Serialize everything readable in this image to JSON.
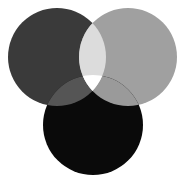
{
  "diagram": {
    "type": "venn-3",
    "background": "#ffffff",
    "circles": [
      {
        "id": "left",
        "cx": 57,
        "cy": 57,
        "r": 49,
        "color": "#3a3a3a"
      },
      {
        "id": "right",
        "cx": 128,
        "cy": 57,
        "r": 49,
        "color": "#a0a0a0"
      },
      {
        "id": "bottom",
        "cx": 93,
        "cy": 125,
        "r": 50,
        "color": "#0a0a0a"
      }
    ],
    "regions": {
      "left_right": "#dcdcdc",
      "left_bottom": "#555555",
      "right_bottom": "#9a9a9a",
      "all_three": "#ffffff"
    }
  }
}
